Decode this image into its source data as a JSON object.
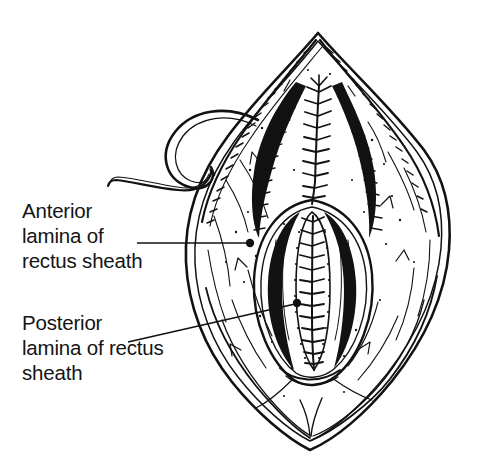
{
  "figure": {
    "kind": "line-art-anatomical-illustration",
    "background_color": "#ffffff",
    "ink_color": "#121212",
    "width": 480,
    "height": 475
  },
  "labels": [
    {
      "id": "anterior-lamina",
      "lines": [
        "Anterior",
        "lamina of",
        "rectus sheath"
      ],
      "text_x": 22,
      "line_y": [
        218,
        243,
        268
      ],
      "font_size": 20.5,
      "leader": {
        "type": "straight",
        "x1": 137,
        "y1": 243,
        "x2": 248,
        "y2": 243,
        "dot_x": 250,
        "dot_y": 243,
        "dot_r": 4.2
      }
    },
    {
      "id": "posterior-lamina",
      "lines": [
        "Posterior",
        "lamina of rectus",
        "sheath"
      ],
      "text_x": 22,
      "line_y": [
        330,
        355,
        380
      ],
      "font_size": 20.5,
      "leader": {
        "type": "straight",
        "x1": 128,
        "y1": 342,
        "x2": 295,
        "y2": 304,
        "dot_x": 297,
        "dot_y": 303,
        "dot_r": 4.2
      }
    }
  ],
  "anatomy": {
    "outer_wound_apex_top": {
      "x": 318,
      "y": 33
    },
    "outer_wound_apex_bottom": {
      "x": 310,
      "y": 450
    },
    "outer_wound_left_extent": 186,
    "outer_wound_right_extent": 450,
    "inner_cavity": {
      "center_x": 312,
      "top_y": 205,
      "bottom_y": 380,
      "half_width": 52
    },
    "suture_lines": [
      {
        "id": "upper-midline-suture",
        "description": "Continuous ladder suture closing the anterior lamina along the upper midline",
        "top_y": 86,
        "bottom_y": 205,
        "x": 319,
        "stitch_count": 11,
        "stitch_spacing": 11
      },
      {
        "id": "inner-cavity-suture",
        "description": "Continuous ladder suture on the posterior lamina within the open cavity",
        "top_y": 214,
        "bottom_y": 372,
        "x": 312,
        "stitch_count": 14,
        "stitch_spacing": 11
      }
    ],
    "needle": {
      "id": "curved-surgical-needle",
      "description": "Curved surgical needle with trailing suture thread emerging at upper left",
      "tip_x": 108,
      "tip_y": 186,
      "entry_x": 258,
      "entry_y": 120
    }
  }
}
